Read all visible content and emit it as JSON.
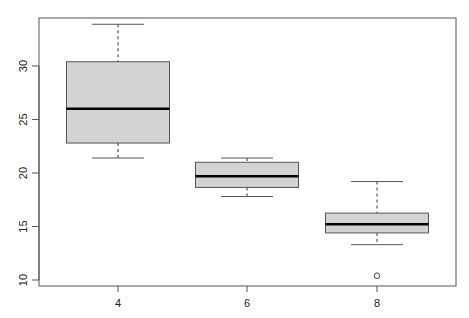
{
  "chart_data": {
    "type": "boxplot",
    "title": "",
    "xlabel": "",
    "ylabel": "",
    "categories": [
      "4",
      "6",
      "8"
    ],
    "ylim": [
      9.4,
      34.6
    ],
    "y_ticks": [
      10,
      15,
      20,
      25,
      30
    ],
    "x_ticks": [
      "4",
      "6",
      "8"
    ],
    "grid": false,
    "legend": null,
    "boxes": [
      {
        "category": "4",
        "whisker_low": 21.4,
        "q1": 22.8,
        "median": 26.0,
        "q3": 30.4,
        "whisker_high": 33.9,
        "outliers": []
      },
      {
        "category": "6",
        "whisker_low": 17.8,
        "q1": 18.65,
        "median": 19.7,
        "q3": 21.0,
        "whisker_high": 21.4,
        "outliers": []
      },
      {
        "category": "8",
        "whisker_low": 13.3,
        "q1": 14.4,
        "median": 15.2,
        "q3": 16.25,
        "whisker_high": 19.2,
        "outliers": [
          10.4
        ]
      }
    ],
    "colors": {
      "box_fill": "#d3d3d3",
      "box_border": "#555555",
      "median": "#000000",
      "axis": "#555555"
    }
  },
  "axis": {
    "y_labels": [
      "10",
      "15",
      "20",
      "25",
      "30"
    ],
    "x_labels": [
      "4",
      "6",
      "8"
    ]
  }
}
